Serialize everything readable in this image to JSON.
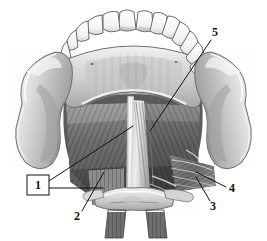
{
  "figure": {
    "background_color": "#ffffff",
    "ink_color": "#111111",
    "width": 267,
    "height": 241,
    "style": "grayscale halftone anatomical engraving"
  },
  "labels": [
    {
      "id": "label-1",
      "text": "1",
      "boxed": true,
      "x": 38,
      "y": 185,
      "box": {
        "x": 27,
        "y": 175,
        "width": 22,
        "height": 20
      },
      "leaders": [
        {
          "from": [
            49,
            181
          ],
          "to": [
            133,
            126
          ]
        },
        {
          "from": [
            49,
            188
          ],
          "to": [
            103,
            188
          ]
        }
      ]
    },
    {
      "id": "label-2",
      "text": "2",
      "boxed": false,
      "x": 77,
      "y": 217,
      "leaders": [
        {
          "from": [
            82,
            211
          ],
          "to": [
            104,
            172
          ]
        }
      ]
    },
    {
      "id": "label-3",
      "text": "3",
      "boxed": false,
      "x": 213,
      "y": 207,
      "leaders": [
        {
          "from": [
            210,
            201
          ],
          "to": [
            196,
            177
          ]
        }
      ]
    },
    {
      "id": "label-4",
      "text": "4",
      "boxed": false,
      "x": 232,
      "y": 189,
      "leaders": [
        {
          "from": [
            226,
            187
          ],
          "to": [
            196,
            172
          ]
        }
      ]
    },
    {
      "id": "label-5",
      "text": "5",
      "boxed": false,
      "x": 215,
      "y": 33,
      "leaders": [
        {
          "from": [
            211,
            40
          ],
          "to": [
            150,
            131
          ]
        }
      ]
    }
  ],
  "structures": [
    {
      "name": "upper-dental-arch",
      "description": "row of teeth along upper arch"
    },
    {
      "name": "mandibular-ramus-left",
      "description": "left ramus with coronoid and condylar process"
    },
    {
      "name": "mandibular-ramus-right",
      "description": "right ramus with coronoid and condylar process"
    },
    {
      "name": "mylohyoid-muscle-left",
      "description": "striated fan of fibers on left"
    },
    {
      "name": "mylohyoid-muscle-right",
      "description": "striated fan of fibers on right"
    },
    {
      "name": "median-raphe",
      "description": "pale vertical midline band"
    },
    {
      "name": "geniohyoid-muscle",
      "description": "central paired muscle strap"
    },
    {
      "name": "hyoid-bone",
      "description": "transverse bone at lower midline"
    },
    {
      "name": "infrahyoid-strips",
      "description": "two descending muscle strips below hyoid"
    },
    {
      "name": "digastric-fibers-right",
      "description": "oblique fan of fibers lower right"
    }
  ]
}
